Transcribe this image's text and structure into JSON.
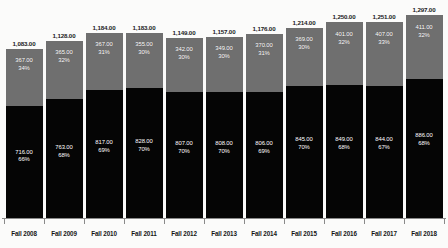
{
  "chart_data": {
    "type": "bar",
    "subtype": "stacked-column",
    "title": "",
    "subtitle": "",
    "xlabel": "",
    "ylabel": "",
    "grid": false,
    "legend": "none",
    "ylim": [
      0,
      1297
    ],
    "categories": [
      "Fall 2008",
      "Fall 2009",
      "Fall 2010",
      "Fall 2011",
      "Fall 2012",
      "Fall 2013",
      "Fall 2014",
      "Fall 2015",
      "Fall 2016",
      "Fall 2017",
      "Fall 2018"
    ],
    "series": [
      {
        "name": "lower-segment",
        "color": "#050505",
        "values": [
          716,
          763,
          817,
          828,
          807,
          808,
          806,
          845,
          849,
          844,
          886
        ],
        "value_labels": [
          "716.00",
          "763.00",
          "817.00",
          "828.00",
          "807.00",
          "808.00",
          "806.00",
          "845.00",
          "849.00",
          "844.00",
          "886.00"
        ],
        "percent_labels": [
          "66%",
          "68%",
          "69%",
          "70%",
          "70%",
          "70%",
          "69%",
          "70%",
          "68%",
          "67%",
          "68%"
        ]
      },
      {
        "name": "upper-segment",
        "color": "#6f6f6f",
        "values": [
          367,
          365,
          367,
          355,
          342,
          349,
          370,
          369,
          401,
          407,
          411
        ],
        "value_labels": [
          "367.00",
          "365.00",
          "367.00",
          "355.00",
          "342.00",
          "349.00",
          "370.00",
          "369.00",
          "401.00",
          "407.00",
          "411.00"
        ],
        "percent_labels": [
          "34%",
          "32%",
          "31%",
          "30%",
          "30%",
          "30%",
          "31%",
          "30%",
          "32%",
          "33%",
          "32%"
        ]
      }
    ],
    "totals": [
      1083,
      1128,
      1184,
      1183,
      1149,
      1157,
      1176,
      1214,
      1250,
      1251,
      1297
    ],
    "total_labels": [
      "1,083.00",
      "1,128.00",
      "1,184.00",
      "1,183.00",
      "1,149.00",
      "1,157.00",
      "1,176.00",
      "1,214.00",
      "1,250.00",
      "1,251.00",
      "1,297.00"
    ]
  },
  "colors": {
    "upper_segment": "#6f6f6f",
    "lower_segment": "#050505",
    "background": "#fbfbfa",
    "axis": "#8a8a8a",
    "label_dark": "#151515",
    "label_light": "#ffffff"
  }
}
